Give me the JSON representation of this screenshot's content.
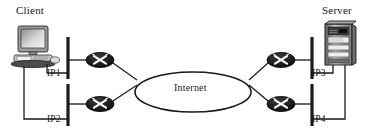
{
  "diagram": {
    "background": "#ffffff",
    "line_color": "#1a1a1a",
    "router_fill": "#121212",
    "device_fill": "#b8b8b8"
  },
  "nodes": {
    "client": {
      "label": "Client",
      "icon": "desktop-computer-icon"
    },
    "server": {
      "label": "Server",
      "icon": "server-tower-icon"
    },
    "cloud": {
      "label": "Internet",
      "shape": "ellipse"
    },
    "routers": [
      {
        "id": "router-top-left",
        "icon": "router-icon"
      },
      {
        "id": "router-bottom-left",
        "icon": "router-icon"
      },
      {
        "id": "router-top-right",
        "icon": "router-icon"
      },
      {
        "id": "router-bottom-right",
        "icon": "router-icon"
      }
    ]
  },
  "interfaces": [
    {
      "id": "ip1",
      "label": "IP1",
      "side": "client",
      "position": "top"
    },
    {
      "id": "ip2",
      "label": "IP2",
      "side": "client",
      "position": "bottom"
    },
    {
      "id": "ip3",
      "label": "IP3",
      "side": "server",
      "position": "top"
    },
    {
      "id": "ip4",
      "label": "IP4",
      "side": "server",
      "position": "bottom"
    }
  ]
}
